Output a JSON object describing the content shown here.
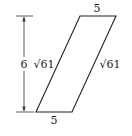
{
  "diagram": {
    "type": "parallelogram",
    "stroke_color": "#222222",
    "background": "#ffffff",
    "labels": {
      "top_side": "5",
      "bottom_side": "5",
      "left_side": "√61",
      "right_side": "√61",
      "height": "6"
    },
    "vertices": {
      "top_left": [
        80,
        16
      ],
      "top_right": [
        116,
        16
      ],
      "bottom_right": [
        72,
        112
      ],
      "bottom_left": [
        36,
        112
      ]
    },
    "height_dimension": {
      "x": 24,
      "y_top": 16,
      "y_bottom": 112,
      "label": "6"
    }
  }
}
